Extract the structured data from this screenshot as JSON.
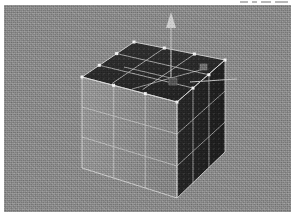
{
  "app": {
    "kind": "3d-modeling-viewport",
    "title": "3D Viewport"
  },
  "viewport": {
    "background_color": "#8b8b8b",
    "width": 287,
    "height": 207,
    "shading": "solid",
    "projection": "perspective"
  },
  "object": {
    "name": "Cube",
    "type": "mesh-cube",
    "subdivisions": 3,
    "faces_visible": [
      "top",
      "left",
      "right"
    ],
    "face_colors": {
      "top": "#2b2b2b",
      "left": "#909090",
      "right": "#242424"
    },
    "wireframe_color": "#d6d6d6",
    "vertex_color": "#f2f2f2",
    "vertex_count_visible": 12,
    "edge_grid": "3x3"
  },
  "gizmo": {
    "name": "move-gizmo",
    "axis": "z",
    "direction": "up",
    "color": "#c9c9c9",
    "handle_color": "#bdbdbd",
    "secondary_axis": "x",
    "secondary_direction": "right"
  },
  "handles": [
    {
      "name": "scale-handle-a",
      "x": 149,
      "y": 43,
      "color": "#6e6e6e"
    },
    {
      "name": "scale-handle-b",
      "x": 167,
      "y": 56,
      "color": "#5a5a5a"
    }
  ],
  "colors": {
    "page_background": "#ffffff",
    "viewport_background": "#8b8b8b",
    "wire": "#d6d6d6",
    "vertex": "#f4f4f4",
    "gizmo": "#c9c9c9"
  }
}
